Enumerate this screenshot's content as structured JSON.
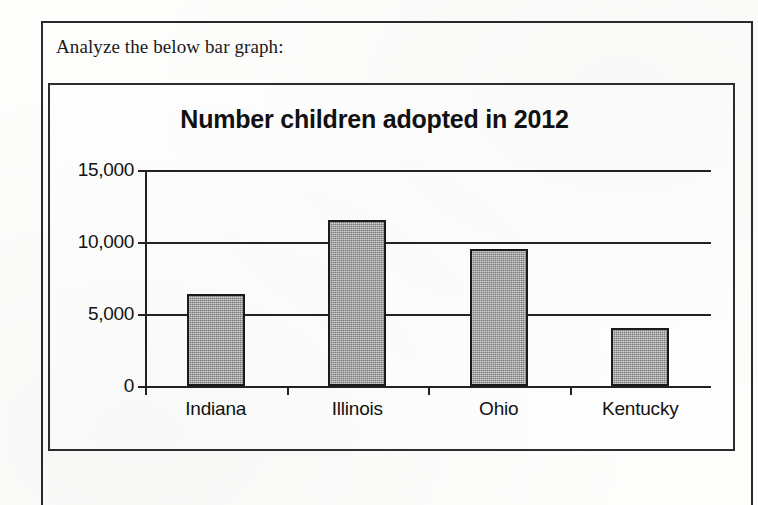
{
  "page": {
    "prompt_text": "Analyze the below bar graph:"
  },
  "chart_data": {
    "type": "bar",
    "title": "Number children adopted in 2012",
    "xlabel": "",
    "ylabel": "",
    "categories": [
      "Indiana",
      "Illinois",
      "Ohio",
      "Kentucky"
    ],
    "values": [
      6400,
      11500,
      9500,
      4000
    ],
    "series": [
      {
        "name": "Children adopted",
        "values": [
          6400,
          11500,
          9500,
          4000
        ]
      }
    ],
    "ylim": [
      0,
      15000
    ],
    "ytick_values": [
      0,
      5000,
      10000,
      15000
    ],
    "ytick_labels": [
      "0",
      "5,000",
      "10,000",
      "15,000"
    ],
    "grid": true,
    "legend": "none",
    "bar_color": "#9a9a9a",
    "bar_edge_color": "#1a1a1a",
    "axis_color": "#222222"
  }
}
